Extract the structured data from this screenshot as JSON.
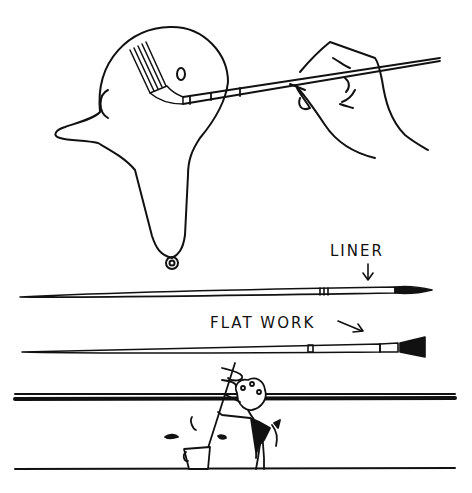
{
  "illustration": {
    "colors": {
      "ink": "#111111",
      "paper": "#ffffff"
    },
    "labels": {
      "liner": "LINER",
      "flat_work": "FLAT WORK"
    },
    "figures": [
      "head-with-brush",
      "hand-holding-brush",
      "liner-brush",
      "flat-work-brush",
      "stirring-figure-with-bucket"
    ]
  }
}
